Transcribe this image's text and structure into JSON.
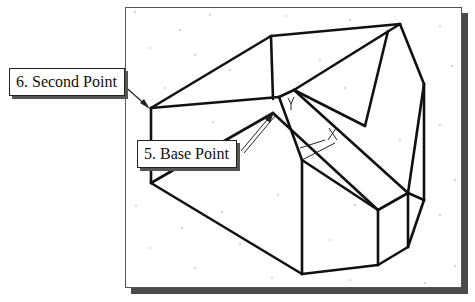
{
  "figure": {
    "callouts": [
      {
        "id": "second-point",
        "label": "6. Second Point"
      },
      {
        "id": "base-point",
        "label": "5. Base Point"
      }
    ],
    "axis_markers": {
      "y_marker": "Y",
      "x_marker": "X"
    },
    "colors": {
      "line": "#111111",
      "shadow": "#4a4a4a",
      "background": "#ffffff"
    }
  }
}
